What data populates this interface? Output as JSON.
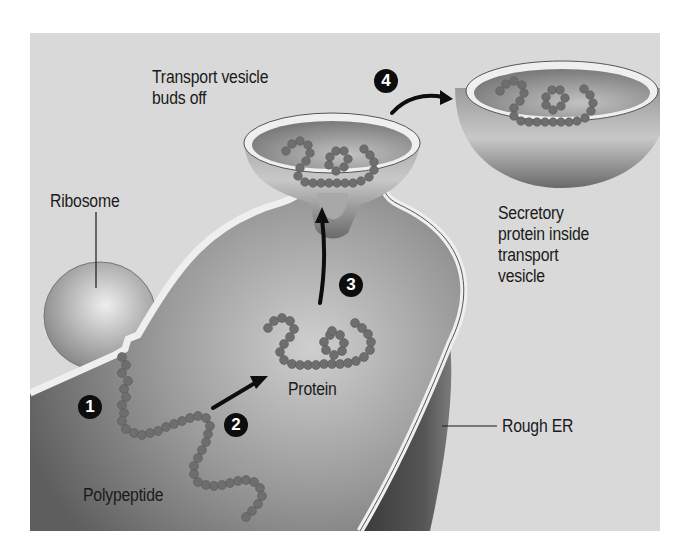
{
  "diagram": {
    "labels": {
      "transport_vesicle_buds_off": "Transport vesicle\nbuds off",
      "ribosome": "Ribosome",
      "secretory_protein": "Secretory\nprotein inside\ntransport\nvesicle",
      "protein": "Protein",
      "rough_er": "Rough ER",
      "polypeptide": "Polypeptide"
    },
    "steps": [
      {
        "number": "1",
        "description": "Polypeptide enters ER from ribosome"
      },
      {
        "number": "2",
        "description": "Polypeptide folds into protein"
      },
      {
        "number": "3",
        "description": "Protein moves into budding vesicle"
      },
      {
        "number": "4",
        "description": "Transport vesicle buds off"
      }
    ],
    "colors": {
      "background": "#d9d9d9",
      "membrane": "#eeeeee",
      "lumen": "#8a8a8a",
      "bead": "#6a6a6a",
      "step_badge": "#0d0d0d"
    }
  }
}
